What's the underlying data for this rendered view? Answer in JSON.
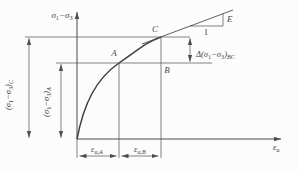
{
  "figure": {
    "type": "stress-strain-curve-diagram",
    "background_color": "#fcfcfc",
    "line_color": "#4d4d4d",
    "text_color": "#474747"
  },
  "axes": {
    "y_title": {
      "sigma_a": "σ",
      "sub_1": "1",
      "minus": "−",
      "sigma_b": "σ",
      "sub_3": "3"
    },
    "x_title": {
      "epsilon": "ε",
      "sub_a": "a"
    }
  },
  "points": {
    "a": "A",
    "b": "B",
    "c": "C"
  },
  "slope_triangle": {
    "modulus": "E",
    "run": "1"
  },
  "ordinates": {
    "c": {
      "open": "(σ",
      "sub_1": "1",
      "mid": "−σ",
      "sub_3": "3",
      "close": ")",
      "point_sub": "C"
    },
    "a": {
      "open": "(σ",
      "sub_1": "1",
      "mid": "−σ",
      "sub_3": "3",
      "close": ")",
      "point_sub": "A"
    }
  },
  "delta": {
    "open": "Δ(σ",
    "sub_1": "1",
    "mid": "−σ",
    "sub_3": "3",
    "close": ")",
    "point_sub": "BC"
  },
  "strains": {
    "a": {
      "base": "ε",
      "sub": "a,A"
    },
    "b": {
      "base": "ε",
      "sub": "a,B"
    }
  }
}
